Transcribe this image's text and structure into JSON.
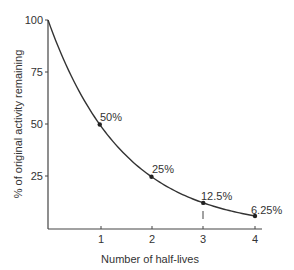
{
  "chart_data": {
    "type": "line",
    "title": "",
    "xlabel": "Number of half-lives",
    "ylabel": "% of original activity remaining",
    "x": [
      0,
      1,
      2,
      3,
      4
    ],
    "values": [
      100,
      50,
      25,
      12.5,
      6.25
    ],
    "series": [
      {
        "name": "Activity remaining",
        "x": [
          0,
          1,
          2,
          3,
          4
        ],
        "values": [
          100,
          50,
          25,
          12.5,
          6.25
        ]
      }
    ],
    "point_labels": [
      {
        "x": 1,
        "y": 50,
        "label": "50%"
      },
      {
        "x": 2,
        "y": 25,
        "label": "25%"
      },
      {
        "x": 3,
        "y": 12.5,
        "label": "12.5%"
      },
      {
        "x": 4,
        "y": 6.25,
        "label": "6.25%"
      }
    ],
    "xticks": [
      "1",
      "2",
      "3",
      "4"
    ],
    "yticks": [
      "25",
      "50",
      "75",
      "100"
    ],
    "xlim": [
      0,
      4.15
    ],
    "ylim": [
      0,
      100
    ],
    "grid": false,
    "legend": "none",
    "curve": "exponential decay (halving each half-life)"
  },
  "labels": {
    "x_axis": "Number of half-lives",
    "y_axis": "% of original activity remaining",
    "xticks": [
      "1",
      "2",
      "3",
      "4"
    ],
    "yticks": [
      "25",
      "50",
      "75",
      "100"
    ],
    "points": [
      "50%",
      "25%",
      "12.5%",
      "6.25%"
    ]
  }
}
